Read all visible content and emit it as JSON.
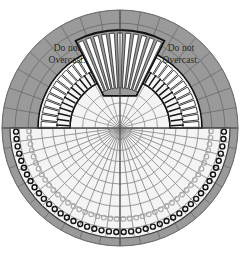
{
  "diagram": {
    "canvas": {
      "width": 240,
      "height": 257
    },
    "center": {
      "x": 120,
      "y": 128
    },
    "outer_radius": 118,
    "colors": {
      "outer_fill": "#9a9a9a",
      "inner_fill": "#f2f2f2",
      "grid_line": "#6f6f6f",
      "axis_line": "#4a4a4a",
      "outline": "#111111",
      "stitch_mark": "#ffffff",
      "text": "#2b2b2b",
      "background": "#ffffff"
    },
    "labels": {
      "left": "Do not\nOvercast.",
      "right": "Do not\nOvercast."
    },
    "grid": {
      "radial_spokes": 36,
      "concentric_rings": 9,
      "axes": [
        "horizontal",
        "vertical"
      ]
    },
    "elements": {
      "top_fan": {
        "name": "fan-motif",
        "stripes": 11,
        "angle_span_deg": 54,
        "inner_radius": 36,
        "outer_radius": 98
      },
      "upper_band": {
        "name": "upper-stitch-band",
        "blocks": 34,
        "ticks": 34,
        "inner_radius": 50,
        "outer_radius": 82
      },
      "lower_arc": {
        "name": "lower-ring-stitches",
        "rings": 44,
        "radius": 104,
        "ring_size": 5
      }
    }
  }
}
